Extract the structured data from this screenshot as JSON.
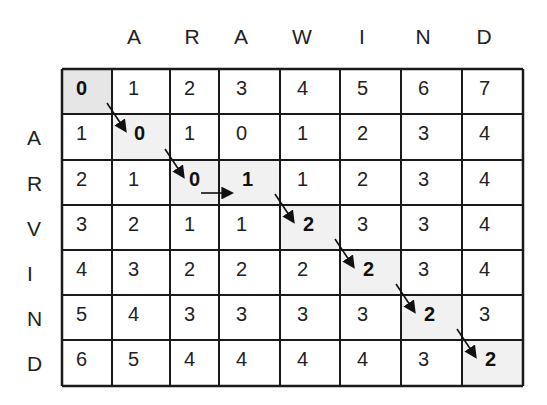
{
  "column_string": [
    "A",
    "R",
    "A",
    "W",
    "I",
    "N",
    "D"
  ],
  "row_string": [
    "A",
    "R",
    "V",
    "I",
    "N",
    "D"
  ],
  "matrix": [
    [
      0,
      1,
      2,
      3,
      4,
      5,
      6,
      7
    ],
    [
      1,
      0,
      1,
      0,
      1,
      2,
      3,
      4
    ],
    [
      2,
      1,
      0,
      1,
      1,
      2,
      3,
      4
    ],
    [
      3,
      2,
      1,
      1,
      2,
      3,
      3,
      4
    ],
    [
      4,
      3,
      2,
      2,
      2,
      2,
      3,
      4
    ],
    [
      5,
      4,
      3,
      3,
      3,
      3,
      2,
      3
    ],
    [
      6,
      5,
      4,
      4,
      4,
      4,
      3,
      2
    ]
  ],
  "path": [
    [
      0,
      0
    ],
    [
      1,
      1
    ],
    [
      2,
      2
    ],
    [
      2,
      3
    ],
    [
      3,
      4
    ],
    [
      4,
      5
    ],
    [
      5,
      6
    ],
    [
      6,
      7
    ]
  ],
  "arrows": [
    {
      "from": [
        0,
        0
      ],
      "to": [
        1,
        1
      ],
      "type": "diagonal"
    },
    {
      "from": [
        1,
        1
      ],
      "to": [
        2,
        2
      ],
      "type": "diagonal"
    },
    {
      "from": [
        2,
        2
      ],
      "to": [
        2,
        3
      ],
      "type": "horizontal"
    },
    {
      "from": [
        2,
        3
      ],
      "to": [
        3,
        4
      ],
      "type": "diagonal"
    },
    {
      "from": [
        3,
        4
      ],
      "to": [
        4,
        5
      ],
      "type": "diagonal"
    },
    {
      "from": [
        4,
        5
      ],
      "to": [
        5,
        6
      ],
      "type": "diagonal"
    },
    {
      "from": [
        5,
        6
      ],
      "to": [
        6,
        7
      ],
      "type": "diagonal"
    }
  ],
  "final_distance": 2,
  "colors": {
    "grid_line": "#1a1a1a",
    "path_shade": "#f1f1f1",
    "origin_shade": "#e6e6e6",
    "text": "#222222"
  }
}
